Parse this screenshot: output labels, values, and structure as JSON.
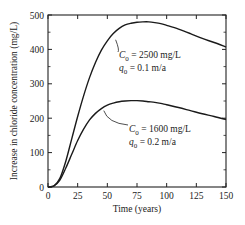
{
  "chart_data": {
    "type": "line",
    "title": "",
    "xlabel": "Time (years)",
    "ylabel": "Increase in chloride concentration (mg/L)",
    "xlim": [
      0,
      150
    ],
    "ylim": [
      0,
      500
    ],
    "xticks": [
      0,
      25,
      50,
      75,
      100,
      125,
      150
    ],
    "yticks": [
      0,
      100,
      200,
      300,
      400,
      500
    ],
    "grid": false,
    "legend": "inline annotations with leader lines",
    "series": [
      {
        "name": "C0 = 2500 mg/L, q0 = 0.1 m/a",
        "annotation": {
          "line1_var": "C",
          "line1_sub": "0",
          "line1_rest": " = 2500 mg/L",
          "line2_var": "q",
          "line2_sub": "0",
          "line2_rest": " = 0.1 m/a"
        },
        "x": [
          0,
          5,
          10,
          15,
          20,
          25,
          30,
          35,
          40,
          45,
          50,
          55,
          60,
          65,
          70,
          75,
          80,
          85,
          90,
          95,
          100,
          110,
          120,
          130,
          140,
          150
        ],
        "y": [
          0,
          3,
          25,
          75,
          140,
          205,
          265,
          318,
          362,
          398,
          425,
          446,
          461,
          471,
          476,
          479,
          480,
          480,
          478,
          475,
          470,
          459,
          446,
          432,
          420,
          407
        ]
      },
      {
        "name": "C0 = 1600 mg/L, q0 = 0.2 m/a",
        "annotation": {
          "line1_var": "C",
          "line1_sub": "0",
          "line1_rest": " = 1600 mg/L",
          "line2_var": "q",
          "line2_sub": "0",
          "line2_rest": " = 0.2 m/a"
        },
        "x": [
          0,
          5,
          10,
          15,
          20,
          25,
          30,
          35,
          40,
          45,
          50,
          55,
          60,
          65,
          70,
          75,
          80,
          85,
          90,
          95,
          100,
          110,
          120,
          130,
          140,
          150
        ],
        "y": [
          0,
          3,
          20,
          55,
          95,
          135,
          168,
          195,
          214,
          228,
          238,
          244,
          248,
          250,
          251,
          251,
          250,
          248,
          246,
          243,
          239,
          231,
          222,
          213,
          205,
          196
        ]
      }
    ]
  },
  "axes": {
    "x_label": "Time (years)",
    "y_label": "Increase in chloride concentration (mg/L)"
  }
}
